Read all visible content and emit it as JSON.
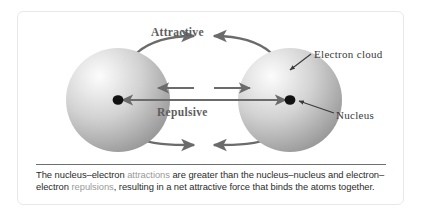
{
  "figure": {
    "labels": {
      "attractive": "Attractive",
      "repulsive": "Repulsive",
      "electron_cloud": "Electron cloud",
      "nucleus": "Nucleus"
    },
    "caption": {
      "part1": "The nucleus–electron ",
      "highlight1": "attractions",
      "part2": " are greater than the nucleus–nucleus and electron–electron ",
      "highlight2": "repulsions",
      "part3": ", resulting in a net attractive force that binds the atoms together.",
      "full_text": "The nucleus–electron attractions are greater than the nucleus–nucleus and electron–electron repulsions, resulting in a net attractive force that binds the atoms together."
    },
    "colors": {
      "arrow": "#6b6b6b",
      "sphere_light": "#f2f2f2",
      "sphere_mid": "#c9c9c9",
      "sphere_dark": "#8f8f8f",
      "nucleus": "#111111",
      "highlight_text": "#9a9a9a",
      "body_text": "#2b2b2b",
      "border": "#e8e8e8"
    },
    "atoms": [
      {
        "name": "left-atom",
        "cx": 100,
        "cy": 88,
        "r": 52
      },
      {
        "name": "right-atom",
        "cx": 272,
        "cy": 88,
        "r": 52
      }
    ],
    "forces": [
      {
        "name": "attractive-top",
        "type": "attractive",
        "path": "curved-over-top"
      },
      {
        "name": "attractive-bottom",
        "type": "attractive",
        "path": "curved-under-bottom"
      },
      {
        "name": "attractive-nucleus-line",
        "type": "attractive",
        "path": "straight-nucleus-to-nucleus"
      },
      {
        "name": "repulsive-pair",
        "type": "repulsive",
        "path": "straight-outward-center"
      }
    ]
  }
}
